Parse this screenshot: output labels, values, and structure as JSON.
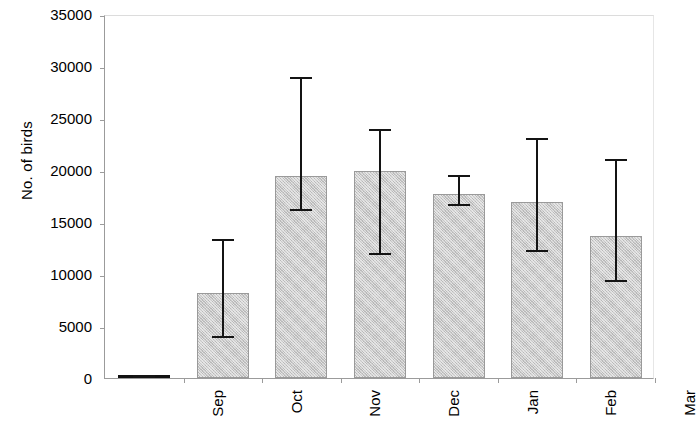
{
  "chart_data": {
    "type": "bar",
    "title": "",
    "subtitle": "",
    "xlabel": "",
    "ylabel": "No. of birds",
    "categories": [
      "Sep",
      "Oct",
      "Nov",
      "Dec",
      "Jan",
      "Feb",
      "Mar"
    ],
    "values": [
      150,
      8200,
      19400,
      19900,
      17700,
      16900,
      13700
    ],
    "error_low": [
      0,
      3800,
      16100,
      11800,
      16500,
      12100,
      9200
    ],
    "error_high": [
      300,
      13400,
      28900,
      23900,
      19500,
      23100,
      21100
    ],
    "ylim": [
      0,
      35000
    ],
    "yticks": [
      0,
      5000,
      10000,
      15000,
      20000,
      25000,
      30000,
      35000
    ],
    "ytick_labels": [
      "0",
      "5000",
      "10000",
      "15000",
      "20000",
      "25000",
      "30000",
      "35000"
    ],
    "grid": false,
    "legend": null,
    "bar_color": "#c9c9c9",
    "bar_edge_color": "#9a9a9a",
    "error_color": "#141414",
    "axis_color": "#9b9b9b"
  }
}
